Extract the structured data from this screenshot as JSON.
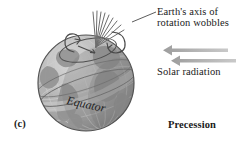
{
  "figure": {
    "panel_letter": "(c)",
    "caption": "Precession",
    "background_color": "#ffffff",
    "ink_color": "#1a1a1a"
  },
  "annotations": {
    "axis_wobble": {
      "line1": "Earth's axis of",
      "line2": "rotation wobbles"
    },
    "solar_radiation": "Solar radiation",
    "equator": "Equator"
  },
  "arrows": {
    "solar_arrow_color": "#aeaeae",
    "solar_arrow_count": 2,
    "solar_arrow_direction": "left"
  },
  "globe": {
    "body_color": "#b4b4b4",
    "shadow_color": "#8d8d8d",
    "highlight_color": "#d6d6d6",
    "outline_color": "#4d4d4d",
    "grid_color": "#cfcfcf",
    "land_color": "#9b9b9b",
    "equator_band_color": "#c2c2c2",
    "axis_fan_line_count": 9,
    "axis_fan_color": "#6f6f6f"
  }
}
